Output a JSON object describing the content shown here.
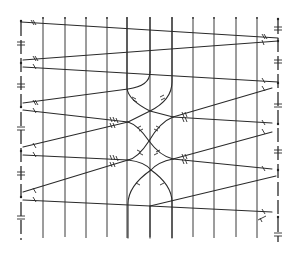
{
  "diagram": {
    "colors": {
      "ink": "#2a2a2a",
      "background": "#ffffff"
    },
    "vertical_lines_x": [
      43,
      65,
      86,
      107,
      127,
      150,
      172,
      193,
      214,
      236,
      257
    ],
    "vertical_lines_top_y": 19,
    "vertical_lines_bottom_y": 238,
    "left_border": {
      "x": 21,
      "dots_y": [
        21,
        63,
        107,
        151,
        197
      ]
    },
    "right_border": {
      "x": 278,
      "dots_y": [
        19,
        41,
        83,
        124,
        170,
        217
      ]
    },
    "nodes": [
      {
        "name": "left-upper-node",
        "x": 128,
        "y": 122
      },
      {
        "name": "right-upper-node",
        "x": 173,
        "y": 117
      },
      {
        "name": "left-lower-node",
        "x": 128,
        "y": 160
      },
      {
        "name": "right-lower-node",
        "x": 173,
        "y": 159
      }
    ],
    "crossings": [
      {
        "x": 150,
        "y": 111
      },
      {
        "x": 149,
        "y": 141
      },
      {
        "x": 151,
        "y": 170
      }
    ],
    "strands": [
      {
        "name": "strand-1",
        "path": "M21,22 L278,38"
      },
      {
        "name": "strand-2",
        "path": "M23,60 L278,41"
      },
      {
        "name": "strand-3",
        "path": "M23,67 L278,82"
      },
      {
        "name": "strand-4",
        "path": "M23,103 L128,89 Q150,86 150,72"
      },
      {
        "name": "strand-5",
        "path": "M23,110 L128,122"
      },
      {
        "name": "strand-6",
        "path": "M23,147 L128,122"
      },
      {
        "name": "strand-7",
        "path": "M23,155 L128,160"
      },
      {
        "name": "strand-8",
        "path": "M23,192 L128,160"
      },
      {
        "name": "strand-9",
        "path": "M23,200 L150,206 L272,212"
      },
      {
        "name": "strand-10",
        "path": "M150,206 L276,176"
      },
      {
        "name": "arc-left-top",
        "path": "M127,19 L127,88 Q128,100 150,111 L173,117"
      },
      {
        "name": "arc-right-top",
        "path": "M172,19 L172,82 Q172,100 150,111 L128,122"
      },
      {
        "name": "cross-a",
        "path": "M128,122 Q138,125 149,141 Q160,156 173,159"
      },
      {
        "name": "cross-b",
        "path": "M173,117 Q160,122 149,141 Q138,158 128,160"
      },
      {
        "name": "arc-left-bottom",
        "path": "M128,160 Q145,162 151,170 Q172,185 172,202 L172,238"
      },
      {
        "name": "arc-right-bottom",
        "path": "M173,159 Q158,162 151,170 Q128,186 128,204 L128,238"
      },
      {
        "name": "strand-r1",
        "path": "M173,117 L272,88"
      },
      {
        "name": "strand-r2",
        "path": "M173,117 L272,123"
      },
      {
        "name": "strand-r3",
        "path": "M173,159 L272,132"
      },
      {
        "name": "strand-r4",
        "path": "M173,159 L272,169"
      },
      {
        "name": "center-bottom-vertical",
        "path": "M150,206 L150,238"
      },
      {
        "name": "center-top-hook",
        "path": "M150,19 L150,72"
      }
    ]
  }
}
